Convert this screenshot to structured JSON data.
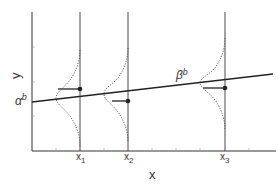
{
  "diagram": {
    "type": "regression-with-conditional-distributions",
    "axis_labels": {
      "x": "x",
      "y": "y"
    },
    "x_ticks": [
      {
        "label": "x",
        "sub": "1"
      },
      {
        "label": "x",
        "sub": "2"
      },
      {
        "label": "x",
        "sub": "3"
      }
    ],
    "line_labels": {
      "intercept": {
        "base": "α",
        "sup": "b"
      },
      "slope": {
        "base": "β",
        "sup": "b"
      }
    },
    "colors": {
      "stroke": "#333333",
      "background": "#ffffff"
    }
  }
}
